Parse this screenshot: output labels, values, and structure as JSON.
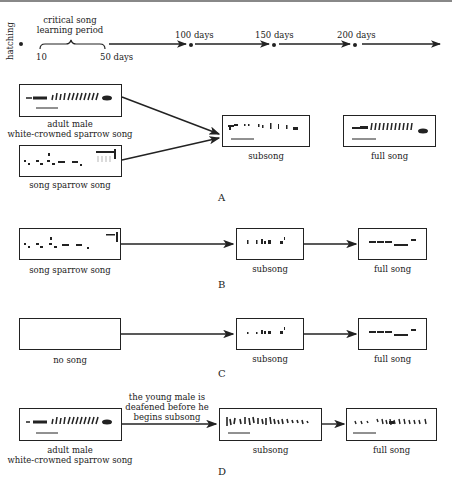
{
  "timeline": {
    "start_label": "hatching",
    "critical_period_label_line1": "critical song",
    "critical_period_label_line2": "learning period",
    "critical_start": "10",
    "critical_end": "50 days",
    "milestones": [
      "100 days",
      "150 days",
      "200 days"
    ]
  },
  "panel_a": {
    "letter": "A",
    "tutor1_label_line1": "adult male",
    "tutor1_label_line2": "white-crowned sparrow song",
    "tutor2_label": "song sparrow song",
    "subsong_label": "subsong",
    "full_song_label": "full song"
  },
  "panel_b": {
    "letter": "B",
    "tutor_label": "song sparrow song",
    "subsong_label": "subsong",
    "full_song_label": "full song"
  },
  "panel_c": {
    "letter": "C",
    "tutor_label": "no song",
    "subsong_label": "subsong",
    "full_song_label": "full song"
  },
  "panel_d": {
    "letter": "D",
    "annotation_line1": "the young male is",
    "annotation_line2": "deafened before he",
    "annotation_line3": "begins subsong",
    "tutor_label_line1": "adult male",
    "tutor_label_line2": "white-crowned sparrow song",
    "subsong_label": "subsong",
    "full_song_label": "full song"
  },
  "colors": {
    "ink": "#222222",
    "background": "#ffffff",
    "top_rule": "#888888"
  }
}
